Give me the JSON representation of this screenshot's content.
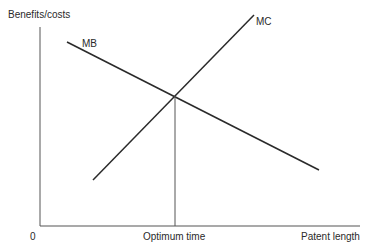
{
  "diagram": {
    "y_axis_label": "Benefits/costs",
    "x_axis_label": "Patent length",
    "origin_label": "0",
    "optimum_label": "Optimum time",
    "curves": [
      {
        "name": "MB",
        "label": "MB",
        "description": "Marginal benefit, downward sloping"
      },
      {
        "name": "MC",
        "label": "MC",
        "description": "Marginal cost, upward sloping"
      }
    ],
    "line_color": "#2a2a2a"
  }
}
